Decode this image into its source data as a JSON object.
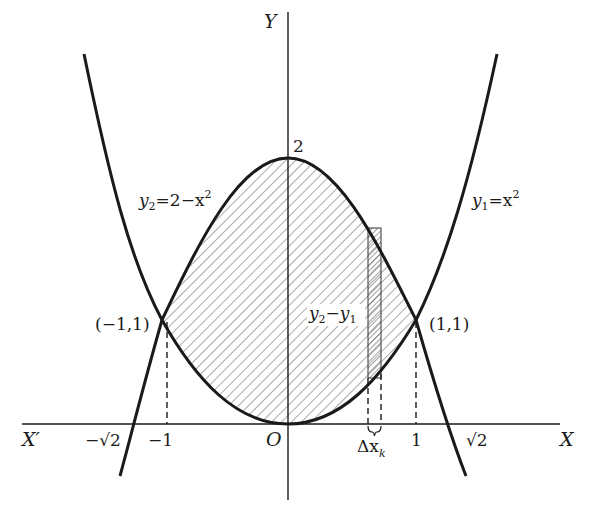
{
  "figure": {
    "axes": {
      "x_label": "X",
      "x_neg_label": "X′",
      "y_label": "Y",
      "origin_label": "O"
    },
    "ticks": {
      "neg_sqrt2": "−√2",
      "neg_one": "−1",
      "one": "1",
      "sqrt2": "√2",
      "two": "2"
    },
    "points": {
      "left_intersection": "(−1,1)",
      "right_intersection": "(1,1)"
    },
    "curves": {
      "lower_curve": {
        "lhs": "y",
        "sub": "1",
        "rhs": "=x",
        "sup": "2"
      },
      "upper_curve": {
        "lhs": "y",
        "sub": "2",
        "rhs": "=2−x",
        "sup": "2"
      }
    },
    "strip": {
      "height_label_a": "y",
      "height_sub_a": "2",
      "height_minus": "−",
      "height_label_b": "y",
      "height_sub_b": "1",
      "width_label": "Δx",
      "width_sub": "k"
    },
    "colors": {
      "ink": "#1a1a1a",
      "background": "#ffffff",
      "hatch": "#555555"
    }
  }
}
